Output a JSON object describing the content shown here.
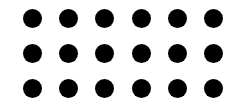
{
  "canvas": {
    "width": 236,
    "height": 103,
    "background": "#ffffff"
  },
  "dot_grid": {
    "rows": 3,
    "columns": 6,
    "dot_color": "#000000",
    "dot_diameter": 19,
    "origin_center": [
      32.5,
      18.5
    ],
    "column_spacing": 36.2,
    "row_spacing": 34.8,
    "total_dots": 18
  }
}
